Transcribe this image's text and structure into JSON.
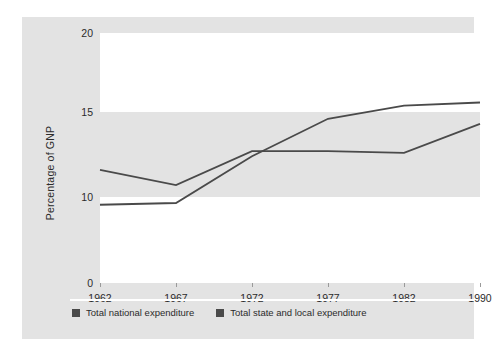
{
  "chart_data": {
    "type": "line",
    "title": "",
    "xlabel": "",
    "ylabel": "Percentage of GNP",
    "x": [
      "1962",
      "1967",
      "1972",
      "1977",
      "1982",
      "1990"
    ],
    "categories": [
      "1962",
      "1967",
      "1972",
      "1977",
      "1982",
      "1990"
    ],
    "series": [
      {
        "name": "Total national expenditure",
        "color": "#4a4a4a",
        "values": [
          9.1,
          9.3,
          12.4,
          14.6,
          15.4,
          15.6
        ]
      },
      {
        "name": "Total state and local expenditure",
        "color": "#4a4a4a",
        "values": [
          11.6,
          10.7,
          12.7,
          12.7,
          12.6,
          14.3
        ]
      }
    ],
    "ylim": [
      0,
      20
    ],
    "yticks": [
      0,
      10,
      15,
      20
    ],
    "ytick_labels": [
      "0",
      "10",
      "15",
      "20"
    ],
    "grid": false,
    "bands": [
      {
        "from": 15,
        "to": 20,
        "color": "#ffffff"
      },
      {
        "from": 10,
        "to": 15,
        "color": "#e3e3e3"
      },
      {
        "from": 0,
        "to": 10,
        "color": "#ffffff"
      }
    ],
    "legend_position": "bottom-left"
  },
  "axis": {
    "y_title": "Percentage of GNP",
    "y_ticks": [
      {
        "value": 20,
        "label": "20"
      },
      {
        "value": 15,
        "label": "15"
      },
      {
        "value": 10,
        "label": "10"
      },
      {
        "value": 0,
        "label": "0"
      }
    ],
    "x_ticks": [
      {
        "value": 1962,
        "label": "1962"
      },
      {
        "value": 1967,
        "label": "1967"
      },
      {
        "value": 1972,
        "label": "1972"
      },
      {
        "value": 1977,
        "label": "1977"
      },
      {
        "value": 1982,
        "label": "1982"
      },
      {
        "value": 1990,
        "label": "1990"
      }
    ]
  },
  "legend": {
    "items": [
      {
        "label": "Total national expenditure",
        "color": "#4a4a4a"
      },
      {
        "label": "Total state and local expenditure",
        "color": "#4a4a4a"
      }
    ]
  },
  "colors": {
    "figure_background": "#ffffff",
    "panel_background": "#e3e3e3",
    "band_white": "#ffffff",
    "line": "#4a4a4a",
    "text": "#2b2b2b",
    "tick_mark": "#9a9a9a"
  }
}
